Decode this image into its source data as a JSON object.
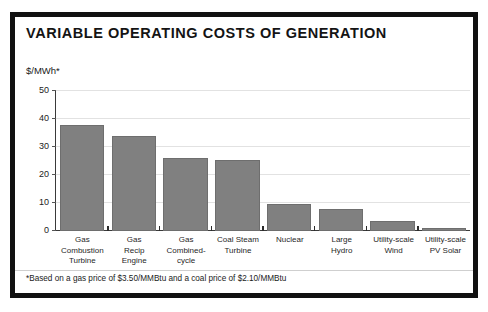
{
  "figure": {
    "title": "VARIABLE OPERATING COSTS OF GENERATION",
    "y_axis_label": "$/MWh*",
    "footnote": "*Based on a gas price of $3.50/MMBtu and a coal price of $2.10/MMBtu",
    "frame_color": "#111111",
    "bar_color": "#808080",
    "grid_color": "#e2e2e2",
    "axis_color": "#3a3a3a"
  },
  "chart_data": {
    "type": "bar",
    "title": "VARIABLE OPERATING COSTS OF GENERATION",
    "xlabel": "",
    "ylabel": "$/MWh*",
    "ylim": [
      0,
      50
    ],
    "yticks": [
      0,
      10,
      20,
      30,
      40,
      50
    ],
    "ytick_labels": [
      "0",
      "10",
      "20",
      "30",
      "40",
      "50"
    ],
    "grid": true,
    "legend": false,
    "orientation": "vertical",
    "bar_color": "#808080",
    "categories": [
      "Gas Combustion Turbine",
      "Gas Recip Engine",
      "Gas Combined-cycle",
      "Coal Steam Turbine",
      "Nuclear",
      "Large Hydro",
      "Utility-scale Wind",
      "Utility-scale PV Solar"
    ],
    "category_lines": [
      [
        "Gas",
        "Combustion",
        "Turbine"
      ],
      [
        "Gas",
        "Recip",
        "Engine"
      ],
      [
        "Gas",
        "Combined-",
        "cycle"
      ],
      [
        "Coal Steam",
        "Turbine"
      ],
      [
        "Nuclear"
      ],
      [
        "Large",
        "Hydro"
      ],
      [
        "Utility-scale",
        "Wind"
      ],
      [
        "Utility-scale",
        "PV Solar"
      ]
    ],
    "values": [
      38,
      34,
      26,
      25.5,
      9.7,
      7.8,
      3.5,
      1
    ],
    "annotation": "*Based on a gas price of $3.50/MMBtu and a coal price of $2.10/MMBtu"
  }
}
